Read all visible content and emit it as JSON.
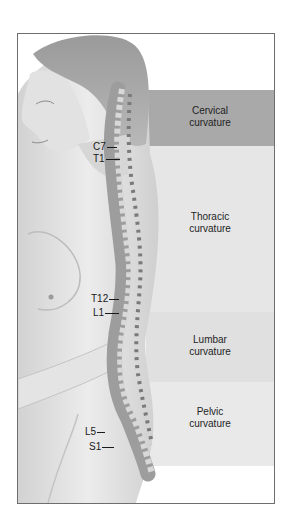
{
  "figure": {
    "colors": {
      "frame_border": "#6e6e6e",
      "cervical_band": "#a9a9a9",
      "thoracic_band": "#e6e6e6",
      "lumbar_band": "#e0e0e0",
      "pelvic_band": "#e9e9e9",
      "label_text": "#1f1f1f"
    },
    "regions": [
      {
        "name": "Cervical",
        "line1": "Cervical",
        "line2": "curvature"
      },
      {
        "name": "Thoracic",
        "line1": "Thoracic",
        "line2": "curvature"
      },
      {
        "name": "Lumbar",
        "line1": "Lumbar",
        "line2": "curvature"
      },
      {
        "name": "Pelvic",
        "line1": "Pelvic",
        "line2": "curvature"
      }
    ],
    "vertebra_labels": [
      {
        "label": "C7"
      },
      {
        "label": "T1"
      },
      {
        "label": "T12"
      },
      {
        "label": "L1"
      },
      {
        "label": "L5"
      },
      {
        "label": "S1"
      }
    ]
  }
}
